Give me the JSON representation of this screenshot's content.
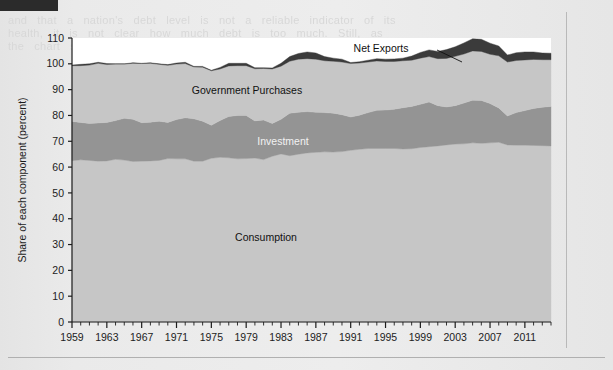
{
  "figure": {
    "background_color": "#ececec",
    "plot_background_color": "#ffffff"
  },
  "ghost": {
    "top_block": "and   that   a   nation's   debt   level   is   not   a   reliable   indicator   of   its\nhealth,   it   is   not   clear   how   much   debt   is   too   much.   Still,   as\nthe   chart   shows,   the   role   of   the   four   components   of   GDP",
    "side_block": "relative   shares   have   shifted   over\ntime.   Consumption   has   grown\nwhile   investment   and   government\npurchases   have   fluctuated."
  },
  "chart_data": {
    "type": "area",
    "stacked": true,
    "title": "",
    "xlabel": "",
    "ylabel": "Share of each component (percent)",
    "ylim": [
      0,
      110
    ],
    "ytick_step": 10,
    "yticks": [
      0,
      10,
      20,
      30,
      40,
      50,
      60,
      70,
      80,
      90,
      100,
      110
    ],
    "xlim": [
      1959,
      2014
    ],
    "xticks": [
      1959,
      1963,
      1967,
      1971,
      1975,
      1979,
      1983,
      1987,
      1991,
      1995,
      1999,
      2003,
      2007,
      2011
    ],
    "x_minor_step": 1,
    "grid": false,
    "legend_position": "inline-labels",
    "annotations": [
      {
        "name": "net-exports",
        "text": "Net Exports",
        "x_px": 381,
        "y_px": 52,
        "style": "dark",
        "leader": {
          "x1": 437,
          "y1": 50,
          "x2": 462,
          "y2": 62
        }
      },
      {
        "name": "government-purchases",
        "text": "Government Purchases",
        "x_px": 247,
        "y_px": 94,
        "style": "dark"
      },
      {
        "name": "investment",
        "text": "Investment",
        "x_px": 283,
        "y_px": 145,
        "style": "light"
      },
      {
        "name": "consumption",
        "text": "Consumption",
        "x_px": 266,
        "y_px": 241,
        "style": "dark"
      }
    ],
    "x": [
      1959,
      1960,
      1961,
      1962,
      1963,
      1964,
      1965,
      1966,
      1967,
      1968,
      1969,
      1970,
      1971,
      1972,
      1973,
      1974,
      1975,
      1976,
      1977,
      1978,
      1979,
      1980,
      1981,
      1982,
      1983,
      1984,
      1985,
      1986,
      1987,
      1988,
      1989,
      1990,
      1991,
      1992,
      1993,
      1994,
      1995,
      1996,
      1997,
      1998,
      1999,
      2000,
      2001,
      2002,
      2003,
      2004,
      2005,
      2006,
      2007,
      2008,
      2009,
      2010,
      2011,
      2012,
      2013,
      2014
    ],
    "series": [
      {
        "name": "Consumption",
        "color": "#c6c6c6",
        "values": [
          62.5,
          62.8,
          62.6,
          62.3,
          62.4,
          63.0,
          62.7,
          62.2,
          62.3,
          62.4,
          62.6,
          63.3,
          63.2,
          63.2,
          62.3,
          62.3,
          63.4,
          63.8,
          63.6,
          63.2,
          63.3,
          63.5,
          62.9,
          64.2,
          65.1,
          64.4,
          65.0,
          65.5,
          65.7,
          65.9,
          65.8,
          66.0,
          66.5,
          66.9,
          67.2,
          67.2,
          67.2,
          67.2,
          67.0,
          67.1,
          67.6,
          67.9,
          68.2,
          68.6,
          68.9,
          69.0,
          69.4,
          69.2,
          69.4,
          69.6,
          68.6,
          68.5,
          68.5,
          68.4,
          68.3,
          68.2
        ]
      },
      {
        "name": "Investment",
        "color": "#949494",
        "values": [
          15.2,
          14.5,
          14.3,
          14.8,
          14.9,
          15.0,
          16.2,
          16.3,
          14.9,
          15.0,
          15.2,
          14.0,
          15.2,
          15.9,
          16.4,
          15.5,
          12.8,
          14.2,
          16.0,
          16.8,
          16.7,
          14.4,
          15.3,
          12.7,
          13.4,
          16.5,
          16.2,
          16.0,
          15.5,
          15.2,
          15.1,
          14.3,
          12.9,
          13.2,
          13.9,
          14.8,
          14.9,
          15.2,
          16.0,
          16.4,
          16.7,
          17.3,
          15.6,
          14.7,
          14.9,
          15.8,
          16.5,
          16.6,
          15.2,
          13.3,
          11.2,
          12.6,
          13.4,
          14.3,
          14.9,
          15.3
        ]
      },
      {
        "name": "Government Purchases",
        "color": "#c6c6c6",
        "values": [
          21.6,
          22.0,
          22.6,
          23.1,
          22.4,
          21.9,
          21.0,
          21.7,
          22.9,
          22.8,
          22.0,
          22.1,
          21.5,
          21.0,
          20.1,
          20.9,
          21.1,
          20.0,
          19.6,
          19.3,
          19.3,
          20.2,
          20.0,
          21.1,
          20.6,
          20.1,
          20.6,
          20.5,
          20.6,
          20.1,
          20.1,
          20.4,
          20.7,
          20.2,
          19.6,
          19.1,
          18.8,
          18.5,
          18.2,
          17.9,
          17.9,
          17.6,
          18.2,
          18.8,
          19.1,
          19.0,
          19.1,
          19.0,
          19.1,
          20.2,
          20.9,
          20.2,
          19.6,
          19.0,
          18.4,
          18.1
        ]
      },
      {
        "name": "Net Exports",
        "color": "#3b3b3b",
        "values": [
          0.2,
          0.5,
          0.5,
          0.4,
          0.4,
          0.1,
          0.1,
          0.2,
          0.1,
          0.2,
          0.2,
          0.3,
          0.4,
          0.5,
          0.2,
          0.3,
          0.2,
          0.6,
          1.0,
          0.9,
          0.9,
          0.4,
          0.3,
          0.4,
          1.1,
          1.8,
          2.2,
          2.6,
          2.4,
          1.6,
          1.2,
          1.1,
          0.4,
          0.5,
          0.7,
          0.9,
          0.9,
          1.0,
          1.0,
          1.6,
          2.2,
          2.6,
          2.8,
          3.4,
          3.7,
          4.3,
          4.7,
          4.7,
          4.3,
          3.8,
          2.7,
          3.0,
          3.1,
          2.9,
          2.6,
          2.5
        ]
      }
    ]
  },
  "axes": {
    "tick_color": "#1c1c1c",
    "axis_color": "#1c1c1c"
  }
}
